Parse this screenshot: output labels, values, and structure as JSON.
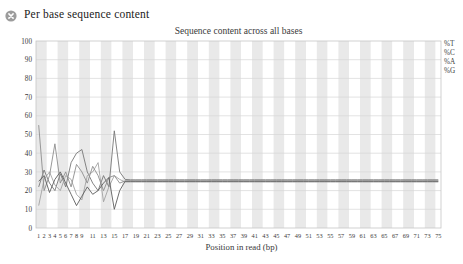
{
  "header": {
    "title": "Per base sequence content",
    "icon": "fail-x-icon",
    "icon_color": "#9c9c9c",
    "icon_glyph_color": "#ffffff"
  },
  "chart_data": {
    "type": "line",
    "title": "Sequence content across all bases",
    "xlabel": "Position in read (bp)",
    "ylabel": "",
    "ylim": [
      0,
      100
    ],
    "xlim": [
      1,
      75
    ],
    "y_ticks": [
      0,
      10,
      20,
      30,
      40,
      50,
      60,
      70,
      80,
      90,
      100
    ],
    "x_tick_labels": [
      "1",
      "2",
      "3",
      "4",
      "5",
      "6",
      "7",
      "8",
      "9",
      "11",
      "13",
      "15",
      "17",
      "19",
      "21",
      "23",
      "25",
      "27",
      "29",
      "31",
      "33",
      "35",
      "37",
      "39",
      "41",
      "43",
      "45",
      "47",
      "49",
      "51",
      "53",
      "55",
      "57",
      "59",
      "61",
      "63",
      "65",
      "67",
      "69",
      "71",
      "73",
      "75"
    ],
    "legend": [
      "%T",
      "%C",
      "%A",
      "%G"
    ],
    "legend_position": "top-right-outside",
    "grid": "horizontal",
    "background_bands": {
      "enabled": true,
      "positions_per_band": 2,
      "first_band": "gray",
      "gray": "#e9e9e9",
      "white": "#ffffff"
    },
    "colors": {
      "grid": "#d7d7d7",
      "border": "#c6c6c6",
      "text": "#3a3a3a"
    },
    "x": [
      1,
      2,
      3,
      4,
      5,
      6,
      7,
      8,
      9,
      10,
      11,
      12,
      13,
      14,
      15,
      16,
      17,
      18,
      19,
      20,
      21,
      22,
      23,
      24,
      25,
      26,
      27,
      28,
      29,
      30,
      31,
      32,
      33,
      34,
      35,
      36,
      37,
      38,
      39,
      40,
      41,
      42,
      43,
      44,
      45,
      46,
      47,
      48,
      49,
      50,
      51,
      52,
      53,
      54,
      55,
      56,
      57,
      58,
      59,
      60,
      61,
      62,
      63,
      64,
      65,
      66,
      67,
      68,
      69,
      70,
      71,
      72,
      73,
      74,
      75
    ],
    "series": [
      {
        "name": "%T",
        "color": "#777777",
        "values": [
          22,
          31,
          24,
          20,
          29,
          22,
          35,
          40,
          42,
          30,
          24,
          20,
          28,
          22,
          52,
          30,
          26,
          25.8,
          25.8,
          25.8,
          25.8,
          25.8,
          25.8,
          25.8,
          25.8,
          25.8,
          25.8,
          25.8,
          25.8,
          25.8,
          25.8,
          25.8,
          25.8,
          25.8,
          25.8,
          25.8,
          25.8,
          25.8,
          25.8,
          25.8,
          25.8,
          25.8,
          25.8,
          25.8,
          25.8,
          25.8,
          25.8,
          25.8,
          25.8,
          25.8,
          25.8,
          25.8,
          25.8,
          25.8,
          25.8,
          25.8,
          25.8,
          25.8,
          25.8,
          25.8,
          25.8,
          25.8,
          25.8,
          25.8,
          25.8,
          25.8,
          25.8,
          25.8,
          25.8,
          25.8,
          25.8,
          25.8,
          25.8,
          25.8,
          25.8
        ]
      },
      {
        "name": "%C",
        "color": "#a3a3a3",
        "values": [
          12,
          26,
          30,
          23,
          20,
          28,
          26,
          18,
          15,
          28,
          30,
          35,
          14,
          22,
          28,
          26,
          24.6,
          24.6,
          24.6,
          24.6,
          24.6,
          24.6,
          24.6,
          24.6,
          24.6,
          24.6,
          24.6,
          24.6,
          24.6,
          24.6,
          24.6,
          24.6,
          24.6,
          24.6,
          24.6,
          24.6,
          24.6,
          24.6,
          24.6,
          24.6,
          24.6,
          24.6,
          24.6,
          24.6,
          24.6,
          24.6,
          24.6,
          24.6,
          24.6,
          24.6,
          24.6,
          24.6,
          24.6,
          24.6,
          24.6,
          24.6,
          24.6,
          24.6,
          24.6,
          24.6,
          24.6,
          24.6,
          24.6,
          24.6,
          24.6,
          24.6,
          24.6,
          24.6,
          24.6,
          24.6,
          24.6,
          24.6,
          24.6,
          24.6,
          24.6
        ]
      },
      {
        "name": "%A",
        "color": "#8d8d8d",
        "values": [
          55,
          20,
          28,
          45,
          24,
          30,
          22,
          34,
          30,
          24,
          33,
          28,
          20,
          27,
          28,
          24,
          25.2,
          25.2,
          25.2,
          25.2,
          25.2,
          25.2,
          25.2,
          25.2,
          25.2,
          25.2,
          25.2,
          25.2,
          25.2,
          25.2,
          25.2,
          25.2,
          25.2,
          25.2,
          25.2,
          25.2,
          25.2,
          25.2,
          25.2,
          25.2,
          25.2,
          25.2,
          25.2,
          25.2,
          25.2,
          25.2,
          25.2,
          25.2,
          25.2,
          25.2,
          25.2,
          25.2,
          25.2,
          25.2,
          25.2,
          25.2,
          25.2,
          25.2,
          25.2,
          25.2,
          25.2,
          25.2,
          25.2,
          25.2,
          25.2,
          25.2,
          25.2,
          25.2,
          25.2,
          25.2,
          25.2,
          25.2,
          25.2,
          25.2,
          25.2
        ]
      },
      {
        "name": "%G",
        "color": "#5c5c5c",
        "values": [
          25,
          28,
          19,
          26,
          30,
          24,
          18,
          12,
          17,
          22,
          18,
          20,
          24,
          27,
          10,
          20,
          25,
          25,
          25,
          25,
          25,
          25,
          25,
          25,
          25,
          25,
          25,
          25,
          25,
          25,
          25,
          25,
          25,
          25,
          25,
          25,
          25,
          25,
          25,
          25,
          25,
          25,
          25,
          25,
          25,
          25,
          25,
          25,
          25,
          25,
          25,
          25,
          25,
          25,
          25,
          25,
          25,
          25,
          25,
          25,
          25,
          25,
          25,
          25,
          25,
          25,
          25,
          25,
          25,
          25,
          25,
          25,
          25,
          25,
          25
        ]
      }
    ]
  }
}
